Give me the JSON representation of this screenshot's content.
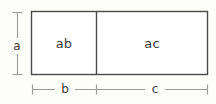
{
  "figure": {
    "kind": "geometry-diagram",
    "background_color": "#fdfdfa"
  },
  "colors": {
    "rectangle_stroke": "#4a4a4a",
    "divider_stroke": "#4a4a4a",
    "dimension_stroke": "#9b9b9b",
    "text": "#3b3b3b"
  },
  "regions": [
    {
      "name": "left-region",
      "label": "ab",
      "x": 31,
      "y": 11,
      "width": 65,
      "height": 64
    },
    {
      "name": "right-region",
      "label": "ac",
      "x": 96,
      "y": 11,
      "width": 112,
      "height": 64
    }
  ],
  "dimensions": {
    "vertical": {
      "name": "height-dimension",
      "label": "a",
      "orientation": "vertical",
      "x": 17,
      "y_start": 12,
      "y_end": 75,
      "tick_half_width": 5
    },
    "horizontal": [
      {
        "name": "width-dimension-b",
        "label": "b",
        "orientation": "horizontal",
        "y": 89,
        "x_start": 32,
        "x_end": 96,
        "tick_half_height": 5
      },
      {
        "name": "width-dimension-c",
        "label": "c",
        "orientation": "horizontal",
        "y": 89,
        "x_start": 96,
        "x_end": 208,
        "tick_half_height": 5
      }
    ]
  },
  "rectangle": {
    "x": 31,
    "y": 11,
    "width": 177,
    "height": 64,
    "divider_x": 96
  }
}
